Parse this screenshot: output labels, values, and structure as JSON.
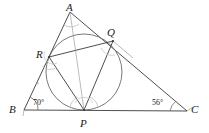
{
  "figure": {
    "width": 209,
    "height": 133,
    "background_color": "#ffffff",
    "stroke_color": "#3a3a3a",
    "light_stroke_color": "#9a9a9a",
    "arc_color": "#b4b4b4"
  },
  "vertices": {
    "A": {
      "label": "A",
      "x": 70,
      "y": 12,
      "label_x": 66,
      "label_y": 2
    },
    "B": {
      "label": "B",
      "x": 24,
      "y": 110,
      "label_x": 9,
      "label_y": 104
    },
    "C": {
      "label": "C",
      "x": 187,
      "y": 111,
      "label_x": 191,
      "label_y": 104
    },
    "P": {
      "label": "P",
      "x": 84,
      "y": 110,
      "label_x": 80,
      "label_y": 118
    },
    "Q": {
      "label": "Q",
      "x": 113,
      "y": 41,
      "label_x": 107,
      "label_y": 27
    },
    "R": {
      "label": "R",
      "x": 49,
      "y": 57,
      "label_x": 36,
      "label_y": 49
    }
  },
  "angles": {
    "B": {
      "value": "70",
      "unit": "°",
      "text": "70°",
      "label_x": 33,
      "label_y": 99
    },
    "C": {
      "value": "56",
      "unit": "°",
      "text": "56°",
      "label_x": 152,
      "label_y": 99
    }
  },
  "segments": [
    {
      "name": "side-AB",
      "from": "A",
      "to": "B"
    },
    {
      "name": "side-BC",
      "from": "B",
      "to": "C"
    },
    {
      "name": "side-CA",
      "from": "C",
      "to": "A"
    },
    {
      "name": "chord-RQ",
      "from": "R",
      "to": "Q"
    },
    {
      "name": "chord-QP",
      "from": "Q",
      "to": "P"
    },
    {
      "name": "chord-PR",
      "from": "P",
      "to": "R"
    }
  ],
  "incircle": {
    "name": "incircle",
    "center_x": 84,
    "center_y": 72,
    "radius": 38
  }
}
